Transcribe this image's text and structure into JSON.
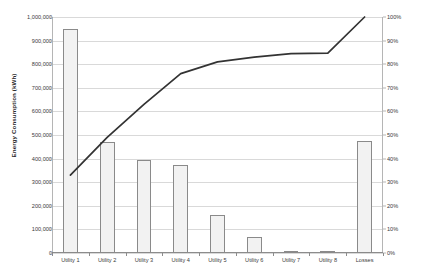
{
  "chart_data": {
    "type": "bar",
    "title": "",
    "xlabel": "",
    "ylabel": "Energy Consumption (kWh)",
    "categories": [
      "Utility 1",
      "Utility 2",
      "Utility 3",
      "Utility 4",
      "Utility 5",
      "Utility 6",
      "Utility 7",
      "Utility 8",
      "Losses"
    ],
    "series": [
      {
        "name": "Energy Consumption (kWh)",
        "type": "bar",
        "axis": "left",
        "values": [
          950000,
          470000,
          395000,
          375000,
          160000,
          68000,
          4000,
          3000,
          475000
        ]
      },
      {
        "name": "Cumulative Percentage",
        "type": "line",
        "axis": "right",
        "values": [
          33,
          49,
          63,
          76,
          81,
          83,
          84.5,
          84.7,
          100
        ]
      }
    ],
    "ylim": [
      0,
      1000000
    ],
    "y2lim": [
      0,
      100
    ],
    "yticks": [
      0,
      100000,
      200000,
      300000,
      400000,
      500000,
      600000,
      700000,
      800000,
      900000,
      1000000
    ],
    "ytick_labels": [
      "0",
      "100,000",
      "200,000",
      "300,000",
      "400,000",
      "500,000",
      "600,000",
      "700,000",
      "800,000",
      "900,000",
      "1,000,000"
    ],
    "y2ticks": [
      0,
      10,
      20,
      30,
      40,
      50,
      60,
      70,
      80,
      90,
      100
    ],
    "y2tick_labels": [
      "0%",
      "10%",
      "20%",
      "30%",
      "40%",
      "50%",
      "60%",
      "70%",
      "80%",
      "90%",
      "100%"
    ],
    "grid": true,
    "legend": "none",
    "colors": {
      "bar_fill": "#f2f2f2",
      "bar_border": "#8a8a8a",
      "line": "#333333",
      "grid": "#d9d9d9",
      "axis": "#8c8c8c",
      "text": "#3a3a3a"
    }
  }
}
